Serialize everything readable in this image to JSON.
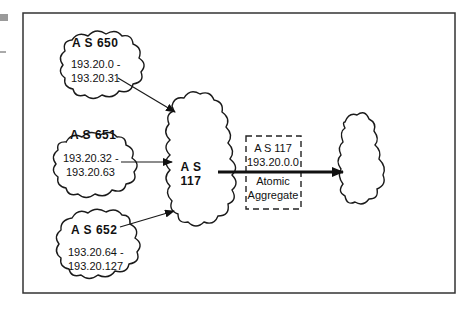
{
  "diagram": {
    "title": "",
    "nodes": [
      {
        "id": "as650",
        "label": "A S  650",
        "range_line1": "193.20.0 -",
        "range_line2": "193.20.31"
      },
      {
        "id": "as651",
        "label": "A S  651",
        "range_line1": "193.20.32 -",
        "range_line2": "193.20.63"
      },
      {
        "id": "as652",
        "label": "A S  652",
        "range_line1": "193.20.64 -",
        "range_line2": "193.20.127"
      },
      {
        "id": "as117",
        "label_line1": "A S",
        "label_line2": "117"
      },
      {
        "id": "peer",
        "label": ""
      }
    ],
    "aggregate_box": {
      "line1": "A S  117",
      "line2": "193.20.0.0",
      "line3": "Atomic",
      "line4": "Aggregate"
    },
    "edges": [
      {
        "from": "as650",
        "to": "as117"
      },
      {
        "from": "as651",
        "to": "as117"
      },
      {
        "from": "as652",
        "to": "as117"
      },
      {
        "from": "as117",
        "to": "peer",
        "style": "thick"
      }
    ],
    "colors": {
      "stroke": "#1a1a1a",
      "background": "#ffffff",
      "margin_mark": "#9a9a9a"
    }
  }
}
